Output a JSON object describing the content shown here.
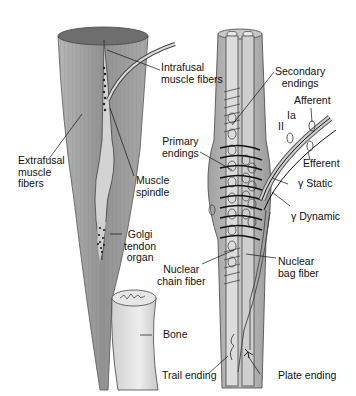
{
  "diagram": {
    "labels": {
      "intrafusal": [
        "Intrafusal",
        "muscle fibers"
      ],
      "extrafusal": [
        "Extrafusal",
        "muscle",
        "fibers"
      ],
      "muscle_spindle": [
        "Muscle",
        "spindle"
      ],
      "golgi": [
        "Golgi",
        "tendon",
        "organ"
      ],
      "bone": "Bone",
      "secondary": [
        "Secondary",
        "endings"
      ],
      "afferent": "Afferent",
      "ia": "Ia",
      "ii": "II",
      "efferent": "Efferent",
      "gamma_static": "γ Static",
      "gamma_dynamic": "γ Dynamic",
      "primary": [
        "Primary",
        "endings"
      ],
      "nuclear_bag": [
        "Nuclear",
        "bag fiber"
      ],
      "nuclear_chain": [
        "Nuclear",
        "chain fiber"
      ],
      "trail": "Trail ending",
      "plate": "Plate ending"
    },
    "colors": {
      "muscle": "#9a9a9a",
      "muscle_dark": "#7d7d7d",
      "spindle_light": "#d8d8d8",
      "bone": "#e2e2e2",
      "line": "#1a1a1a"
    }
  }
}
